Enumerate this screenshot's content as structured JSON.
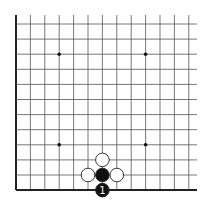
{
  "diagram": {
    "type": "go-board-corner",
    "background": "#ffffff",
    "line_color": "#555555",
    "edge_color": "#222222",
    "columns_visible": 13,
    "rows_visible": 12,
    "edges": [
      "left",
      "bottom"
    ],
    "grid": {
      "x0": 16,
      "dx": 14.4,
      "y0": 24,
      "dy": 15.1,
      "top_extend": 15,
      "right_extend": 197
    },
    "star_points": [
      {
        "col": 3,
        "row": 2
      },
      {
        "col": 9,
        "row": 2
      },
      {
        "col": 3,
        "row": 8
      },
      {
        "col": 9,
        "row": 8
      }
    ],
    "stones": [
      {
        "color": "white",
        "col": 6,
        "row": 9,
        "label": ""
      },
      {
        "color": "white",
        "col": 5,
        "row": 10,
        "label": ""
      },
      {
        "color": "black",
        "col": 6,
        "row": 10,
        "label": ""
      },
      {
        "color": "white",
        "col": 7,
        "row": 10,
        "label": ""
      },
      {
        "color": "black",
        "col": 6,
        "row": 11,
        "label": "1"
      }
    ]
  }
}
